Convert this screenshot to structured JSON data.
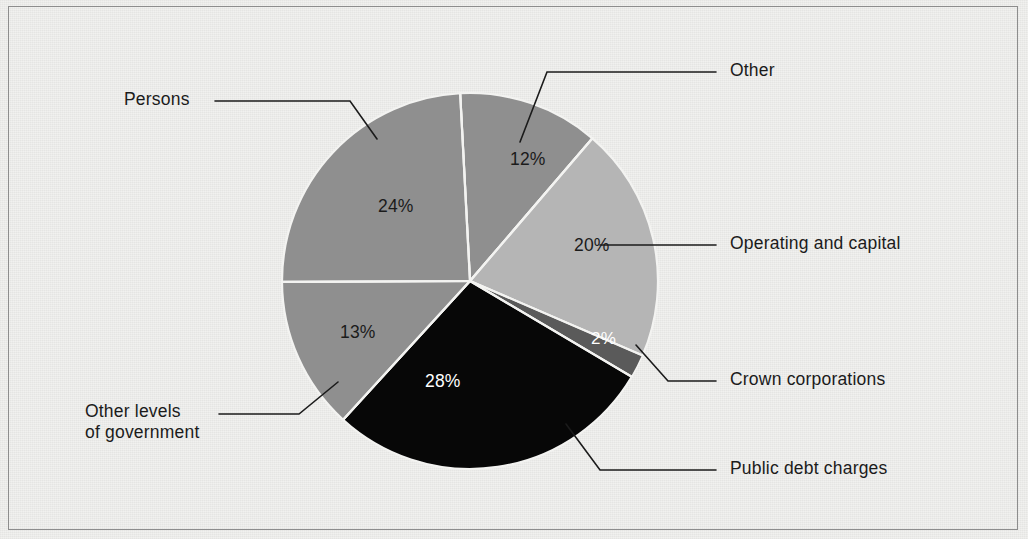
{
  "figure": {
    "background_color": "#f1f1ef",
    "border_color": "#8d8d8d",
    "width": 1028,
    "height": 539
  },
  "chart_data": {
    "type": "pie",
    "title": "",
    "subtitle": "",
    "xlabel": "",
    "ylabel": "",
    "grid": false,
    "legend_position": "callout-labels",
    "units": "percent",
    "total": 99,
    "center": {
      "x": 470,
      "y": 281
    },
    "radius": 188,
    "start_angle_deg": -3,
    "direction": "clockwise",
    "categories": [
      "Other",
      "Operating and capital",
      "Crown corporations",
      "Public debt charges",
      "Other levels of government",
      "Persons"
    ],
    "values": [
      12,
      20,
      2,
      28,
      13,
      24
    ],
    "value_labels": [
      "12%",
      "20%",
      "2%",
      "28%",
      "13%",
      "24%"
    ],
    "colors": [
      "#8f8f8f",
      "#b5b5b5",
      "#5a5a5a",
      "#070707",
      "#8f8f8f",
      "#8f8f8f"
    ],
    "label_text_colors": [
      "#1b1b1b",
      "#1b1b1b",
      "#ffffff",
      "#ffffff",
      "#1b1b1b",
      "#1b1b1b"
    ],
    "slice_separator_color": "#f3f3f1",
    "slices": [
      {
        "name": "Other",
        "value": 12,
        "label": "12%",
        "color": "#8f8f8f",
        "start_deg": -3,
        "end_deg": 40.2
      },
      {
        "name": "Operating and capital",
        "value": 20,
        "label": "20%",
        "color": "#b5b5b5",
        "start_deg": 40.2,
        "end_deg": 112.9
      },
      {
        "name": "Crown corporations",
        "value": 2,
        "label": "2%",
        "color": "#5a5a5a",
        "start_deg": 112.9,
        "end_deg": 120.2
      },
      {
        "name": "Public debt charges",
        "value": 28,
        "label": "28%",
        "color": "#070707",
        "start_deg": 120.2,
        "end_deg": 222.0
      },
      {
        "name": "Other levels of government",
        "value": 13,
        "label": "13%",
        "color": "#8f8f8f",
        "start_deg": 222.0,
        "end_deg": 269.3
      },
      {
        "name": "Persons",
        "value": 24,
        "label": "24%",
        "color": "#8f8f8f",
        "start_deg": 269.3,
        "end_deg": 357.0
      }
    ]
  },
  "value_labels": {
    "other": "12%",
    "operating_and_capital": "20%",
    "crown_corporations": "2%",
    "public_debt_charges": "28%",
    "other_levels_of_government": "13%",
    "persons": "24%"
  },
  "callouts": {
    "other": "Other",
    "operating_and_capital": "Operating and capital",
    "crown_corporations": "Crown corporations",
    "public_debt_charges": "Public debt charges",
    "other_levels_of_government_line1": "Other levels",
    "other_levels_of_government_line2": "of government",
    "persons": "Persons"
  }
}
